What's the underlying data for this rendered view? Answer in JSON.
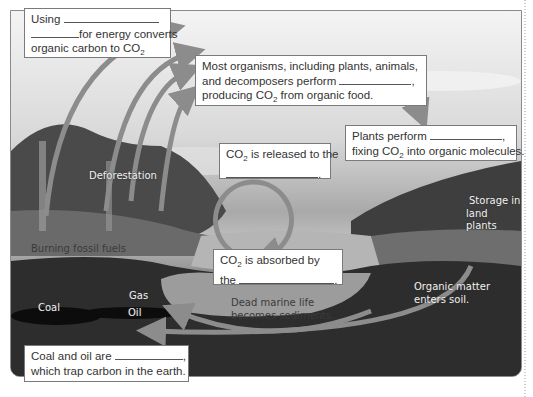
{
  "diagram": {
    "callouts": {
      "combustion": {
        "line1": "Using",
        "line2": "for energy converts",
        "line3": "organic carbon to CO",
        "sub": "2"
      },
      "respiration": {
        "line1": "Most organisms, including plants, animals,",
        "line2": "and decomposers perform",
        "line3_pre": "producing CO",
        "sub": "2",
        "line3_post": " from organic food."
      },
      "photosynthesis": {
        "line1": "Plants perform",
        "line2_pre": "fixing CO",
        "sub": "2",
        "line2_post": " into organic molecules."
      },
      "released": {
        "line1_pre": "CO",
        "sub": "2",
        "line1_post": " is released to the"
      },
      "absorbed": {
        "line1_pre": "CO",
        "sub": "2",
        "line1_post": " is absorbed by",
        "line2": "the"
      },
      "fossil": {
        "line1": "Coal and oil are",
        "line2": "which trap carbon in the earth."
      }
    },
    "labels": {
      "deforestation": "Deforestation",
      "burning_fossil_fuels": "Burning fossil fuels",
      "storage_line1": "Storage in",
      "storage_line2": "land plants",
      "organic_line1": "Organic matter",
      "organic_line2": "enters soil.",
      "dead_line1": "Dead marine life",
      "dead_line2": "becomes sediments.",
      "coal": "Coal",
      "gas": "Gas",
      "oil": "Oil"
    },
    "punctuation": {
      "comma": ",",
      "period": "."
    },
    "colors": {
      "arrow": "#8c8c8c",
      "box_border": "#7a7a7a",
      "soil": "#2b2b2b",
      "sky": "#e6e6e6"
    }
  }
}
